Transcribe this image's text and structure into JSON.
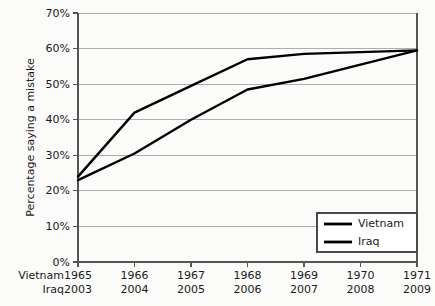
{
  "chart_data": {
    "type": "line",
    "title": "",
    "subtitle": "",
    "xlabel": "",
    "ylabel": "Percentage saying a mistake",
    "ylim": [
      0,
      70
    ],
    "ytick_labels": [
      "0%",
      "10%",
      "20%",
      "30%",
      "40%",
      "50%",
      "60%",
      "70%"
    ],
    "ytick_values": [
      0,
      10,
      20,
      30,
      40,
      50,
      60,
      70
    ],
    "grid": true,
    "legend_position": "bottom-right",
    "x_axis_rows": [
      {
        "header": "Vietnam",
        "ticks": [
          "1965",
          "1966",
          "1967",
          "1968",
          "1969",
          "1970",
          "1971"
        ]
      },
      {
        "header": "Iraq",
        "ticks": [
          "2003",
          "2004",
          "2005",
          "2006",
          "2007",
          "2008",
          "2009"
        ]
      }
    ],
    "categories": [
      "1",
      "2",
      "3",
      "4",
      "5",
      "6",
      "7"
    ],
    "series": [
      {
        "name": "Vietnam",
        "color": "#000000",
        "values": [
          24,
          42,
          49.5,
          57,
          58.5,
          59,
          59.5
        ]
      },
      {
        "name": "Iraq",
        "color": "#000000",
        "values": [
          23,
          30.5,
          40,
          48.5,
          51.5,
          55.5,
          59.5
        ]
      }
    ]
  },
  "legend": {
    "entries": [
      {
        "label": "Vietnam"
      },
      {
        "label": "Iraq"
      }
    ]
  },
  "colors": {
    "background": "#fbfbf9",
    "series": "#000000",
    "gridline": "#aeaeae",
    "axis": "#555555",
    "text": "#1a1a1a"
  }
}
